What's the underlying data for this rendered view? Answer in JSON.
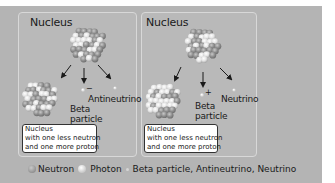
{
  "panels": [
    {
      "title": "Nucleus",
      "decay": "beta-minus",
      "beta_charge": "−",
      "beta_label": [
        "Beta",
        "particle"
      ],
      "emitted_label": "Antineutrino",
      "result_box": [
        "Nucleus",
        "with one less neutron",
        "and one more proton"
      ]
    },
    {
      "title": "Nucleus",
      "decay": "beta-plus",
      "beta_charge": "+",
      "beta_label": [
        "Beta",
        "particle"
      ],
      "emitted_label": "Neutrino",
      "result_box": [
        "Nucleus",
        "with one less neutron",
        "and one more proton"
      ]
    }
  ],
  "legend": [
    {
      "icon": "neutron-icon",
      "label": "Neutron",
      "color": "#8a8a8a"
    },
    {
      "icon": "photon-icon",
      "label": "Photon",
      "color": "#e0e0e0"
    },
    {
      "icon": "small-particle-icon",
      "label": "Beta particle, Antineutrino, Neutrino",
      "color": "#d6d6d6"
    }
  ],
  "colors": {
    "background": "#b4b4b4",
    "panel_border": "#d8d8d8",
    "neutron": "#8a8a8a",
    "proton": "#e6e6e6"
  }
}
